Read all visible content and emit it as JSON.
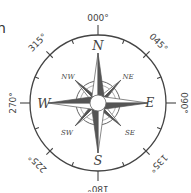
{
  "partial_text": "n",
  "compass": {
    "center": [
      98,
      103
    ],
    "radius": 68,
    "bearings": [
      {
        "label": "000°",
        "angle": 0
      },
      {
        "label": "045°",
        "angle": 45
      },
      {
        "label": "090°",
        "angle": 90
      },
      {
        "label": "135°",
        "angle": 135
      },
      {
        "label": "180°",
        "angle": 180
      },
      {
        "label": "225°",
        "angle": 225
      },
      {
        "label": "270°",
        "angle": 270
      },
      {
        "label": "315°",
        "angle": 315
      }
    ],
    "cardinals": {
      "N": "N",
      "E": "E",
      "S": "S",
      "W": "W"
    },
    "intercardinals": {
      "NE": "NE",
      "SE": "SE",
      "SW": "SW",
      "NW": "NW"
    },
    "colors": {
      "line": "#444444",
      "dark": "#555555",
      "light": "#ffffff",
      "text": "#444444"
    }
  }
}
